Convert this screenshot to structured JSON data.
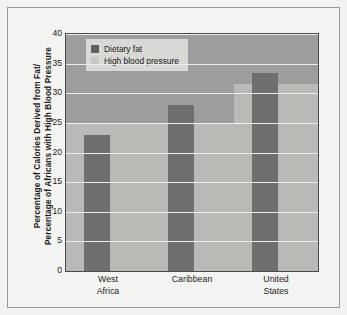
{
  "chart_data": {
    "type": "bar",
    "title": "",
    "xlabel": "",
    "ylabel_line1": "Percentage of Calories Derived from Fat/",
    "ylabel_line2": "Percentage of Africans with High Blood Pressure",
    "categories": [
      "West Africa",
      "Caribbean",
      "United States"
    ],
    "category_lines": [
      [
        "West",
        "Africa"
      ],
      [
        "Caribbean",
        ""
      ],
      [
        "United",
        "States"
      ]
    ],
    "series": [
      {
        "name": "Dietary fat",
        "values": [
          23,
          28,
          33.5
        ],
        "color": "#6e6e6c"
      },
      {
        "name": "High blood pressure",
        "values": [
          25,
          25,
          31.5
        ],
        "color": "#b9b9b6"
      }
    ],
    "ylim": [
      0,
      40
    ],
    "yticks": [
      0,
      5,
      10,
      15,
      20,
      25,
      30,
      35,
      40
    ],
    "ytick_labels": [
      "0",
      "5",
      "10",
      "15",
      "20",
      "25",
      "30",
      "35",
      "40"
    ],
    "grid": true,
    "legend_position": "top-left",
    "plot_background": "#9d9d9b",
    "grid_color": "#ececeb",
    "frame_color": "#9a9a98"
  },
  "legend": {
    "items": [
      {
        "label": "Dietary fat"
      },
      {
        "label": "High blood pressure"
      }
    ]
  }
}
